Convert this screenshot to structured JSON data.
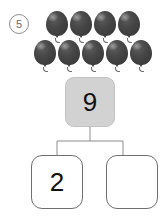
{
  "problem": {
    "number": "5",
    "marker_style": "circled"
  },
  "colors": {
    "balloon_dark": "#474747",
    "balloon_shade": "#3a3a3a",
    "whole_box_fill": "#d2d2d2",
    "line": "#8d8d8d",
    "text": "#111111",
    "page_background": "#ffffff"
  },
  "balloons": {
    "icon": "balloon-icon",
    "total": 9,
    "rows": [
      {
        "count": 4
      },
      {
        "count": 5
      }
    ]
  },
  "number_bond": {
    "whole": {
      "value": "9",
      "filled": true
    },
    "parts": [
      {
        "value": "2",
        "filled": true
      },
      {
        "value": "",
        "filled": false
      }
    ]
  }
}
